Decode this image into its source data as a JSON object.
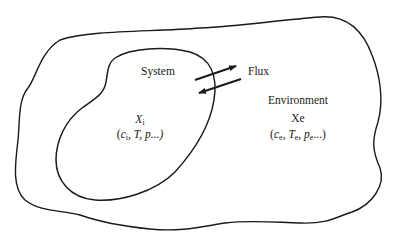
{
  "diagram": {
    "type": "system-environment",
    "regions": {
      "outer": {
        "name": "environment-boundary",
        "stroke": "#1a1a1a"
      },
      "inner": {
        "name": "system-boundary",
        "stroke": "#1a1a1a"
      }
    },
    "labels": {
      "system": "System",
      "flux": "Flux",
      "environment": "Environment",
      "system_var": "X",
      "system_var_sub": "i",
      "system_params_open": "(",
      "system_params_c": "c",
      "system_params_c_sub": "i",
      "system_params_rest": ", T, p...)",
      "env_var": "Xe",
      "env_params_open": "(",
      "env_params_c": "c",
      "env_params_c_sub": "e",
      "env_params_sep1": ", ",
      "env_params_T": "T",
      "env_params_T_sub": "e",
      "env_params_sep2": ", ",
      "env_params_p": "p",
      "env_params_p_sub": "e",
      "env_params_close": "...)"
    },
    "arrows": [
      {
        "name": "flux-out-arrow",
        "direction": "system-to-environment"
      },
      {
        "name": "flux-in-arrow",
        "direction": "environment-to-system"
      }
    ],
    "colors": {
      "line": "#1a1a1a",
      "background": "#ffffff"
    }
  }
}
